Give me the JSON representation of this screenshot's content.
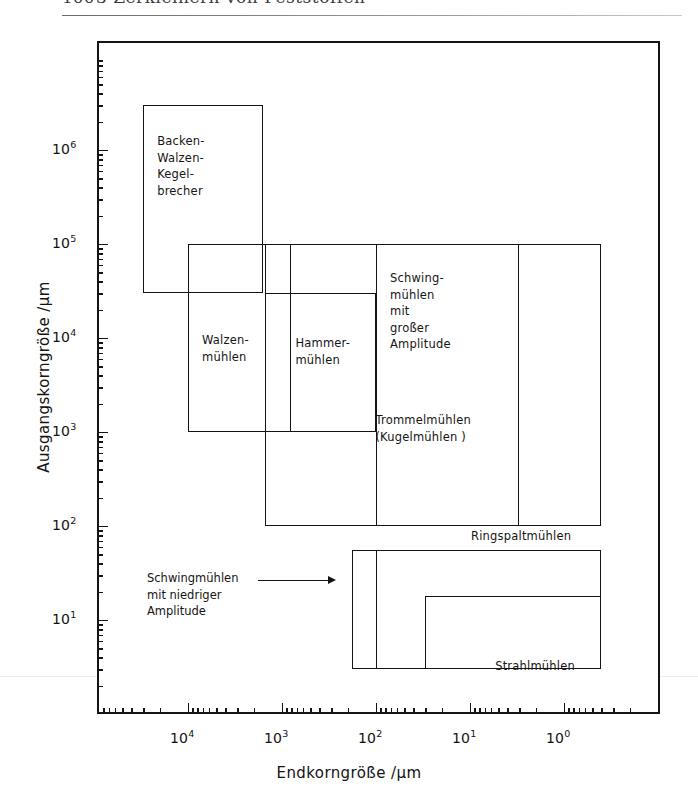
{
  "page_header": {
    "page_number": "100",
    "running_head": "3  Zerkleinern von Feststoffen"
  },
  "chart_data": {
    "type": "range-map",
    "title": "",
    "xlabel": "Endkorngröße /μm",
    "ylabel": "Ausgangskorngröße /μm",
    "x_scale": "log",
    "y_scale": "log",
    "x_reversed": true,
    "xlim": [
      100000,
      0.2
    ],
    "ylim": [
      3,
      6000000
    ],
    "x_ticks": [
      "10⁴",
      "10³",
      "10²",
      "10¹",
      "10⁰"
    ],
    "x_tick_exponents": [
      4,
      3,
      2,
      1,
      0
    ],
    "y_ticks": [
      "10¹",
      "10²",
      "10³",
      "10⁴",
      "10⁵",
      "10⁶"
    ],
    "y_tick_exponents": [
      1,
      2,
      3,
      4,
      5,
      6
    ],
    "grid": false,
    "legend": "none",
    "boxes": [
      {
        "name": "backen-walzen-kegelbrecher",
        "label": "Backen-\nWalzen-\nKegel-\nbrecher",
        "x_range": [
          30000,
          1600
        ],
        "y_range": [
          30000,
          3000000
        ]
      },
      {
        "name": "walzenmuehlen",
        "label": "Walzen-\nmühlen",
        "x_range": [
          10000,
          800
        ],
        "y_range": [
          1000,
          100000
        ]
      },
      {
        "name": "hammermuehlen",
        "label": "Hammer-\nmühlen",
        "x_range": [
          1500,
          100
        ],
        "y_range": [
          1000,
          30000
        ]
      },
      {
        "name": "trommelmuehlen",
        "label": "Trommelmühlen\n(Kugelmühlen )",
        "x_range": [
          1500,
          3
        ],
        "y_range": [
          100,
          100000
        ]
      },
      {
        "name": "schwingmuehlen-grosse-amplitude",
        "label": "Schwing-\nmühlen\nmit\ngroßer\nAmplitude",
        "x_range": [
          100,
          0.4
        ],
        "y_range": [
          100,
          100000
        ]
      },
      {
        "name": "schwingmuehlen-niedrige-amplitude",
        "label": "",
        "x_range": [
          180,
          0.4
        ],
        "y_range": [
          3,
          55
        ]
      },
      {
        "name": "ringspaltmuehlen",
        "label": "Ringspaltmühlen",
        "x_range": [
          100,
          0.4
        ],
        "y_range": [
          3,
          55
        ]
      },
      {
        "name": "strahlmuehlen",
        "label": "Strahlmühlen",
        "x_range": [
          30,
          0.4
        ],
        "y_range": [
          3,
          18
        ]
      }
    ],
    "annotations": [
      {
        "name": "schwingmuehlen-niedrige-amplitude-callout",
        "text": "Schwingmühlen\nmit niedriger\nAmplitude",
        "leader": "arrow-right"
      }
    ]
  }
}
